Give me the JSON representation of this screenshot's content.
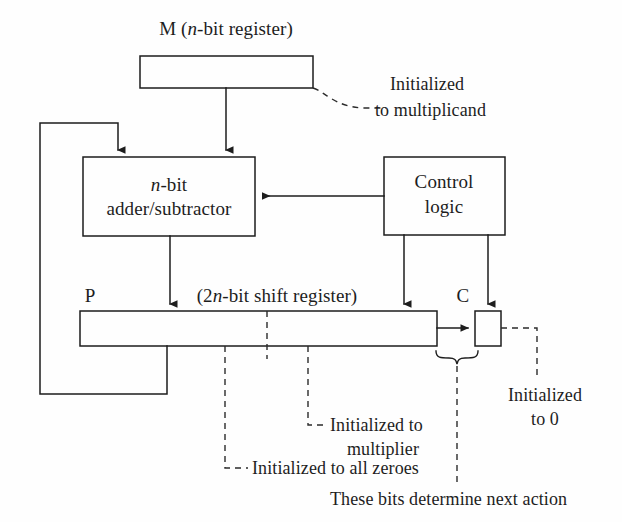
{
  "figure": {
    "type": "block-diagram",
    "line_color": "#1d1d1d",
    "dash_color": "#2b2b2b",
    "background": "#fefefe"
  },
  "labels": {
    "m_register_title_prefix": "M (",
    "m_register_title_italic": "n",
    "m_register_title_suffix": "-bit register)",
    "adder_line1_italic": "n",
    "adder_line1_suffix": "-bit",
    "adder_line2": "adder/subtractor",
    "control_line1": "Control",
    "control_line2": "logic",
    "p_label": "P",
    "shift_register_prefix": "(2",
    "shift_register_italic": "n",
    "shift_register_suffix": "-bit shift register)",
    "c_label": "C"
  },
  "annotations": {
    "multiplicand": {
      "line1": "Initialized",
      "line2": "to multiplicand"
    },
    "multiplier": {
      "line1": "Initialized to",
      "line2": "multiplier"
    },
    "all_zeroes": {
      "line1": "Initialized to all zeroes"
    },
    "carry_zero": {
      "line1": "Initialized",
      "line2": "to 0"
    },
    "next_action": {
      "line1": "These bits determine next action"
    }
  },
  "blocks": [
    {
      "id": "m-register",
      "name": "M register",
      "x": 140,
      "y": 56,
      "w": 173,
      "h": 32
    },
    {
      "id": "adder-subtractor",
      "name": "n-bit adder/subtractor",
      "x": 83,
      "y": 157,
      "w": 172,
      "h": 79
    },
    {
      "id": "control-logic",
      "name": "Control logic",
      "x": 384,
      "y": 157,
      "w": 121,
      "h": 78
    },
    {
      "id": "p-register",
      "name": "P shift register",
      "x": 80,
      "y": 311,
      "w": 357,
      "h": 35
    },
    {
      "id": "c-register",
      "name": "C carry flip-flop",
      "x": 475,
      "y": 311,
      "w": 26,
      "h": 35
    }
  ]
}
